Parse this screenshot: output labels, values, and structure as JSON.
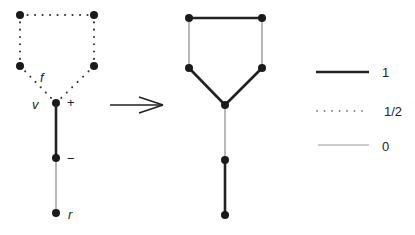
{
  "left_graph": {
    "nodes": [
      {
        "id": "a",
        "x": 20,
        "y": 15
      },
      {
        "id": "b",
        "x": 94,
        "y": 15
      },
      {
        "id": "c",
        "x": 20,
        "y": 66
      },
      {
        "id": "d",
        "x": 94,
        "y": 66
      },
      {
        "id": "v",
        "x": 56,
        "y": 103
      },
      {
        "id": "m",
        "x": 56,
        "y": 158
      },
      {
        "id": "r",
        "x": 56,
        "y": 213
      }
    ],
    "edges": [
      {
        "from": "a",
        "to": "b",
        "weight": "1/2"
      },
      {
        "from": "a",
        "to": "c",
        "weight": "1/2"
      },
      {
        "from": "b",
        "to": "d",
        "weight": "1/2"
      },
      {
        "from": "c",
        "to": "v",
        "weight": "1/2"
      },
      {
        "from": "d",
        "to": "v",
        "weight": "1/2"
      },
      {
        "from": "v",
        "to": "m",
        "weight": "1"
      },
      {
        "from": "m",
        "to": "r",
        "weight": "0"
      }
    ],
    "labels": {
      "f": "f",
      "v": "v",
      "plus": "+",
      "minus": "−",
      "r": "r"
    }
  },
  "right_graph": {
    "nodes": [
      {
        "id": "a",
        "x": 189,
        "y": 18
      },
      {
        "id": "b",
        "x": 262,
        "y": 18
      },
      {
        "id": "c",
        "x": 189,
        "y": 68
      },
      {
        "id": "d",
        "x": 262,
        "y": 68
      },
      {
        "id": "v",
        "x": 225,
        "y": 105
      },
      {
        "id": "m",
        "x": 225,
        "y": 160
      },
      {
        "id": "r",
        "x": 225,
        "y": 215
      }
    ],
    "edges": [
      {
        "from": "a",
        "to": "b",
        "weight": "1"
      },
      {
        "from": "a",
        "to": "c",
        "weight": "0"
      },
      {
        "from": "b",
        "to": "d",
        "weight": "0"
      },
      {
        "from": "c",
        "to": "v",
        "weight": "1"
      },
      {
        "from": "d",
        "to": "v",
        "weight": "1"
      },
      {
        "from": "v",
        "to": "m",
        "weight": "0"
      },
      {
        "from": "m",
        "to": "r",
        "weight": "1"
      }
    ]
  },
  "arrow": {
    "symbol": "right-arrow"
  },
  "legend": {
    "items": [
      {
        "style": "thick",
        "label": "1"
      },
      {
        "style": "dotted",
        "label": "1/2"
      },
      {
        "style": "thin",
        "label": "0"
      }
    ]
  },
  "colors": {
    "ink": "#222222",
    "thin_edge": "#9a9a9a"
  }
}
